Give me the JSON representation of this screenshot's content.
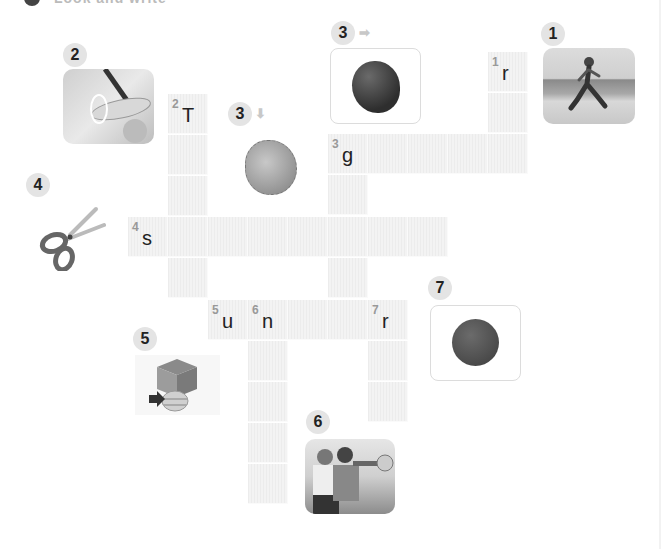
{
  "header": {
    "title_partial": "Look and write"
  },
  "clues": [
    {
      "number": "1",
      "direction": "down",
      "picture": "girl-running-photo",
      "answer_start": "r"
    },
    {
      "number": "2",
      "direction": "down",
      "picture": "finger-touching-screen-photo",
      "answer_start": "T"
    },
    {
      "number": "3",
      "direction": "across",
      "arrow": "➡",
      "picture": "green-blob",
      "answer_start": "g"
    },
    {
      "number": "3",
      "direction": "down",
      "arrow": "⬇",
      "picture": "baseball-glove",
      "answer_start": "g"
    },
    {
      "number": "4",
      "direction": "across",
      "picture": "scissors",
      "answer_start": "s"
    },
    {
      "number": "5",
      "direction": "across",
      "picture": "ball-under-box",
      "answer_start": "u"
    },
    {
      "number": "6",
      "direction": "down",
      "picture": "trumpet-players-photo",
      "answer_start": "n"
    },
    {
      "number": "7",
      "direction": "down",
      "picture": "red-dot",
      "answer_start": "r"
    }
  ],
  "badges": {
    "b1": "1",
    "b2": "2",
    "b3a": "3",
    "b3d": "3",
    "b4": "4",
    "b5": "5",
    "b6": "6",
    "b7": "7"
  },
  "arrows": {
    "across": "➡",
    "down": "⬇"
  },
  "grid": {
    "cells": {
      "r1": {
        "num": "1",
        "letter": "r"
      },
      "T2": {
        "num": "2",
        "letter": "T"
      },
      "g3": {
        "num": "3",
        "letter": "g"
      },
      "s4": {
        "num": "4",
        "letter": "s"
      },
      "u5": {
        "num": "5",
        "letter": "u"
      },
      "n6": {
        "num": "6",
        "letter": "n"
      },
      "r7": {
        "num": "7",
        "letter": "r"
      }
    }
  },
  "colors": {
    "cell_bg": "#f0f0f0",
    "badge_bg": "#e4e4e4",
    "green_blob": "#3d3d3d",
    "red_dot": "#555555"
  }
}
